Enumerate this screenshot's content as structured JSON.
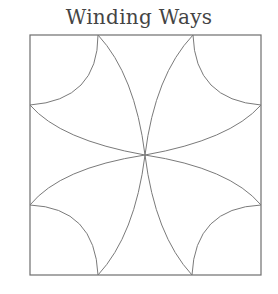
{
  "title": "Winding Ways",
  "diagram": {
    "type": "quilt-block-pattern",
    "square": {
      "x": 30,
      "y": 35,
      "width": 231,
      "height": 240
    },
    "center": {
      "x": 145,
      "y": 155
    },
    "stroke_color": "#7a7a7a"
  }
}
